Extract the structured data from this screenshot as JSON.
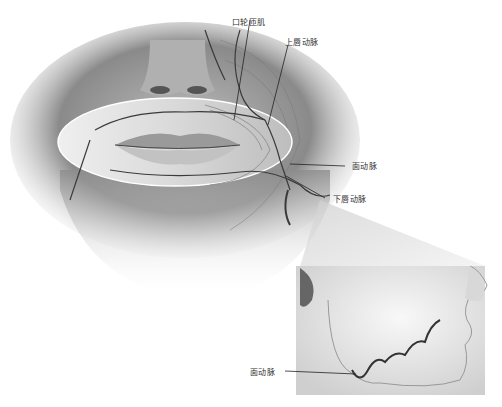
{
  "figure": {
    "type": "anatomical-illustration",
    "main_view": "frontal view of lower face with oval cutaway over lips",
    "inset_view": "lateral view of lower face showing facial artery course"
  },
  "labels": {
    "orbicularis_oris": "口轮匝肌",
    "superior_labial_artery": "上唇动脉",
    "facial_artery_main": "面动脉",
    "inferior_labial_artery": "下唇动脉",
    "facial_artery_inset": "面动脉"
  },
  "colors": {
    "background": "#ffffff",
    "skin_dark": "#6e6e6e",
    "skin_mid": "#a8a8a8",
    "skin_light": "#e6e6e6",
    "artery": "#3a3a3a",
    "label_text": "#333333",
    "leader_line": "#222222"
  }
}
